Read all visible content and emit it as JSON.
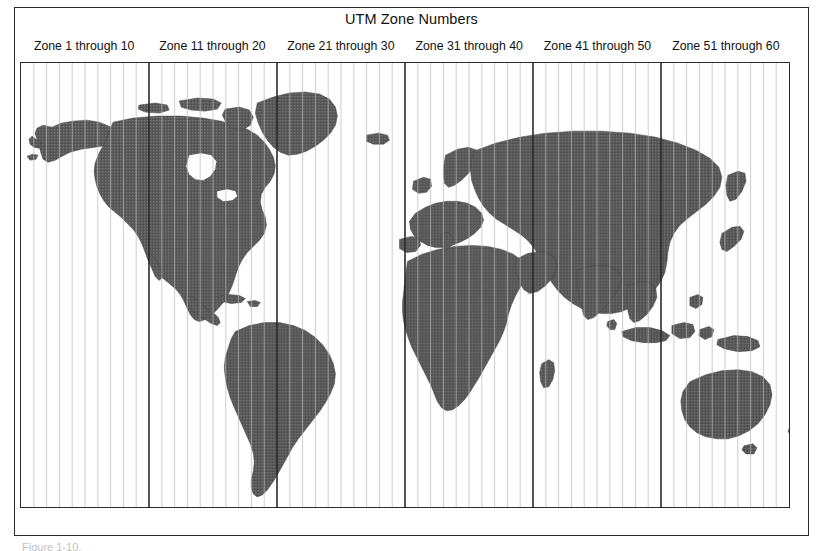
{
  "figure": {
    "title": "UTM Zone Numbers",
    "caption": "Figure 1-10."
  },
  "zone_labels": [
    {
      "text": "Zone 1 through 10",
      "from": 1,
      "to": 10
    },
    {
      "text": "Zone 11 through 20",
      "from": 11,
      "to": 20
    },
    {
      "text": "Zone 21 through 30",
      "from": 21,
      "to": 30
    },
    {
      "text": "Zone 31 through 40",
      "from": 31,
      "to": 40
    },
    {
      "text": "Zone 41 through 50",
      "from": 41,
      "to": 50
    },
    {
      "text": "Zone 51 through 60",
      "from": 51,
      "to": 60
    }
  ],
  "map": {
    "projection": "equirectangular",
    "zone_count": 60,
    "zone_width_degrees": 6,
    "group_size": 10,
    "land_label": "World landmasses",
    "ocean_label": "Ocean"
  },
  "colors": {
    "frame": "#2b2b2b",
    "land_fill": "#555555",
    "land_stroke": "#3d3d3d",
    "ocean": "#ffffff",
    "grid_minor": "#b9b9b9",
    "grid_major": "#2b2b2b",
    "text": "#111111",
    "caption": "#8e8e8e"
  }
}
